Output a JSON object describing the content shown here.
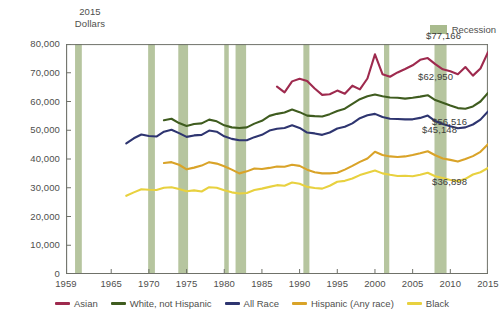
{
  "axis_unit_label": "2015\nDollars",
  "unit_line1": "2015",
  "unit_line2": "Dollars",
  "recession_legend_label": "Recession",
  "colors": {
    "asian": "#9e2a4e",
    "white_not_hispanic": "#3f5c1f",
    "all_race": "#2e3570",
    "hispanic": "#d9a328",
    "black": "#e8d13f",
    "recession_band": "#a9bb8e",
    "axis": "#6f7169",
    "text": "#4f4f4d"
  },
  "callouts": [
    {
      "label": "$77,166",
      "series": "asian"
    },
    {
      "label": "$62,950",
      "series": "white_not_hispanic"
    },
    {
      "label": "$56,516",
      "series": "all_race"
    },
    {
      "label": "$45,148",
      "series": "hispanic"
    },
    {
      "label": "$36,898",
      "series": "black"
    }
  ],
  "legend": {
    "items": [
      {
        "label": "Asian",
        "color": "#9e2a4e"
      },
      {
        "label": "White, not Hispanic",
        "color": "#3f5c1f"
      },
      {
        "label": "All Race",
        "color": "#2e3570"
      },
      {
        "label": "Hispanic (Any race)",
        "color": "#d9a328"
      },
      {
        "label": "Black",
        "color": "#e8d13f"
      }
    ]
  },
  "chart_data": {
    "type": "line",
    "title": "",
    "subtitle": "",
    "xlabel": "",
    "ylabel": "2015 Dollars",
    "xlim": [
      1959,
      2015
    ],
    "ylim": [
      0,
      80000
    ],
    "grid": false,
    "legend_position": "bottom",
    "y_ticks": [
      0,
      10000,
      20000,
      30000,
      40000,
      50000,
      60000,
      70000,
      80000
    ],
    "y_tick_labels": [
      "0",
      "10,000",
      "20,000",
      "30,000",
      "40,000",
      "50,000",
      "60,000",
      "70,000",
      "80,000"
    ],
    "x_ticks": [
      1959,
      1965,
      1970,
      1975,
      1980,
      1985,
      1990,
      1995,
      2000,
      2005,
      2010,
      2015
    ],
    "x_tick_labels": [
      "1959",
      "1965",
      "1970",
      "1975",
      "1980",
      "1985",
      "1990",
      "1995",
      "2000",
      "2005",
      "2010",
      "2015"
    ],
    "recession_bands": [
      [
        1960.2,
        1961.1
      ],
      [
        1969.9,
        1970.8
      ],
      [
        1973.9,
        1975.2
      ],
      [
        1980.0,
        1980.6
      ],
      [
        1981.5,
        1982.9
      ],
      [
        1990.5,
        1991.3
      ],
      [
        2001.2,
        2001.9
      ],
      [
        2007.9,
        2009.5
      ]
    ],
    "series": [
      {
        "name": "Asian",
        "color": "#9e2a4e",
        "end_label": "$77,166",
        "x": [
          1987,
          1988,
          1989,
          1990,
          1991,
          1992,
          1993,
          1994,
          1995,
          1996,
          1997,
          1998,
          1999,
          2000,
          2001,
          2002,
          2003,
          2004,
          2005,
          2006,
          2007,
          2008,
          2009,
          2010,
          2011,
          2012,
          2013,
          2014,
          2015
        ],
        "y": [
          65200,
          63200,
          67000,
          67900,
          67100,
          64500,
          62300,
          62500,
          63800,
          62700,
          65500,
          64200,
          68000,
          76400,
          69500,
          68600,
          70100,
          71300,
          72600,
          74500,
          75100,
          73000,
          71200,
          70500,
          69500,
          72000,
          69000,
          71500,
          77166
        ]
      },
      {
        "name": "White, not Hispanic",
        "color": "#3f5c1f",
        "end_label": "$62,950",
        "x": [
          1972,
          1973,
          1974,
          1975,
          1976,
          1977,
          1978,
          1979,
          1980,
          1981,
          1982,
          1983,
          1984,
          1985,
          1986,
          1987,
          1988,
          1989,
          1990,
          1991,
          1992,
          1993,
          1994,
          1995,
          1996,
          1997,
          1998,
          1999,
          2000,
          2001,
          2002,
          2003,
          2004,
          2005,
          2006,
          2007,
          2008,
          2009,
          2010,
          2011,
          2012,
          2013,
          2014,
          2015
        ],
        "y": [
          53500,
          54000,
          52500,
          51500,
          52200,
          52400,
          53700,
          53100,
          51700,
          51000,
          50800,
          51000,
          52300,
          53300,
          55000,
          55700,
          56200,
          57200,
          56300,
          55100,
          54900,
          54800,
          55600,
          56700,
          57500,
          59200,
          60800,
          61800,
          62400,
          61800,
          61400,
          61300,
          61000,
          61300,
          61700,
          62200,
          60500,
          59600,
          58600,
          57700,
          57500,
          58300,
          60000,
          62950
        ]
      },
      {
        "name": "All Race",
        "color": "#2e3570",
        "end_label": "$56,516",
        "x": [
          1967,
          1968,
          1969,
          1970,
          1971,
          1972,
          1973,
          1974,
          1975,
          1976,
          1977,
          1978,
          1979,
          1980,
          1981,
          1982,
          1983,
          1984,
          1985,
          1986,
          1987,
          1988,
          1989,
          1990,
          1991,
          1992,
          1993,
          1994,
          1995,
          1996,
          1997,
          1998,
          1999,
          2000,
          2001,
          2002,
          2003,
          2004,
          2005,
          2006,
          2007,
          2008,
          2009,
          2010,
          2011,
          2012,
          2013,
          2014,
          2015
        ],
        "y": [
          45400,
          47200,
          48500,
          48000,
          47800,
          49500,
          50200,
          49000,
          47700,
          48200,
          48400,
          49900,
          49500,
          47900,
          47000,
          46500,
          46500,
          47600,
          48400,
          49900,
          50500,
          50800,
          51700,
          50800,
          49200,
          48900,
          48400,
          49200,
          50600,
          51200,
          52400,
          54200,
          55200,
          55700,
          54600,
          54000,
          53900,
          53800,
          53800,
          54300,
          55100,
          53200,
          52200,
          51400,
          50700,
          51000,
          52000,
          53700,
          56516
        ]
      },
      {
        "name": "Hispanic (Any race)",
        "color": "#d9a328",
        "end_label": "$45,148",
        "x": [
          1972,
          1973,
          1974,
          1975,
          1976,
          1977,
          1978,
          1979,
          1980,
          1981,
          1982,
          1983,
          1984,
          1985,
          1986,
          1987,
          1988,
          1989,
          1990,
          1991,
          1992,
          1993,
          1994,
          1995,
          1996,
          1997,
          1998,
          1999,
          2000,
          2001,
          2002,
          2003,
          2004,
          2005,
          2006,
          2007,
          2008,
          2009,
          2010,
          2011,
          2012,
          2013,
          2014,
          2015
        ],
        "y": [
          38600,
          38900,
          38000,
          36400,
          37000,
          37700,
          38900,
          38400,
          37500,
          36300,
          35000,
          35700,
          36700,
          36500,
          36900,
          37400,
          37300,
          38000,
          37600,
          36300,
          35400,
          35000,
          35000,
          35200,
          36300,
          37600,
          39000,
          40200,
          42500,
          41400,
          40900,
          40700,
          40900,
          41400,
          42000,
          42700,
          41300,
          40200,
          39700,
          39100,
          40000,
          41000,
          42500,
          45148
        ]
      },
      {
        "name": "Black",
        "color": "#e8d13f",
        "end_label": "$36,898",
        "x": [
          1967,
          1968,
          1969,
          1970,
          1971,
          1972,
          1973,
          1974,
          1975,
          1976,
          1977,
          1978,
          1979,
          1980,
          1981,
          1982,
          1983,
          1984,
          1985,
          1986,
          1987,
          1988,
          1989,
          1990,
          1991,
          1992,
          1993,
          1994,
          1995,
          1996,
          1997,
          1998,
          1999,
          2000,
          2001,
          2002,
          2003,
          2004,
          2005,
          2006,
          2007,
          2008,
          2009,
          2010,
          2011,
          2012,
          2013,
          2014,
          2015
        ],
        "y": [
          27200,
          28400,
          29500,
          29300,
          29200,
          30000,
          30200,
          29600,
          28800,
          29100,
          28700,
          30200,
          30000,
          29100,
          28400,
          28000,
          28200,
          29200,
          29700,
          30300,
          30900,
          30700,
          31800,
          31400,
          30300,
          29900,
          29700,
          30700,
          32100,
          32400,
          33200,
          34400,
          35200,
          36000,
          35000,
          34500,
          34100,
          34200,
          34000,
          34500,
          35200,
          34000,
          33400,
          32700,
          32300,
          33100,
          34600,
          35400,
          36898
        ]
      }
    ]
  }
}
